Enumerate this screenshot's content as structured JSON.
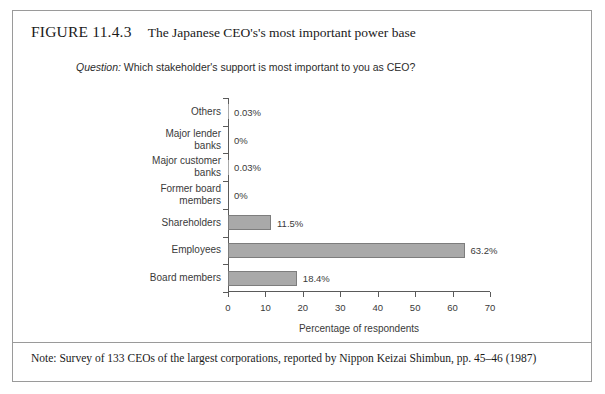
{
  "figure": {
    "number": "FIGURE 11.4.3",
    "caption": "The Japanese CEO's's most important power base",
    "question_label": "Question:",
    "question_text": " Which stakeholder's support is most important to you as CEO?",
    "note": "Note: Survey of 133 CEOs of the largest corporations, reported by Nippon Keizai Shimbun, pp. 45–46 (1987)"
  },
  "chart_data": {
    "type": "bar",
    "orientation": "horizontal",
    "title": "The Japanese CEO's's most important power base",
    "subtitle": "Question: Which stakeholder's support is most important to you as CEO?",
    "xlabel": "Percentage of respondents",
    "ylabel": "",
    "xlim": [
      0,
      70
    ],
    "xticks": [
      0,
      10,
      20,
      30,
      40,
      50,
      60,
      70
    ],
    "xtick_labels": [
      "0",
      "10",
      "20",
      "30",
      "40",
      "50",
      "60",
      "70"
    ],
    "grid": false,
    "legend": false,
    "bar_color": "#a9a9a9",
    "bar_edge_color": "#7d7d7d",
    "categories": [
      "Others",
      "Major lender\nbanks",
      "Major customer\nbanks",
      "Former board\nmembers",
      "Shareholders",
      "Employees",
      "Board members"
    ],
    "values": [
      0.03,
      0,
      0.03,
      0,
      11.5,
      63.2,
      18.4
    ],
    "value_labels": [
      "0.03%",
      "0%",
      "0.03%",
      "0%",
      "11.5%",
      "63.2%",
      "18.4%"
    ]
  }
}
